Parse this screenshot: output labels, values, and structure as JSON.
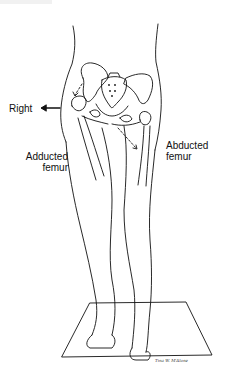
{
  "figure": {
    "labels": {
      "direction": "Right",
      "left_femur_line1": "Adducted",
      "left_femur_line2": "femur",
      "right_femur_line1": "Abducted",
      "right_femur_line2": "femur"
    },
    "signature": "Tina W. M'Alone",
    "icons": {
      "direction_arrow": "arrow-left-icon"
    },
    "colors": {
      "line": "#111111",
      "background": "#ffffff"
    }
  }
}
